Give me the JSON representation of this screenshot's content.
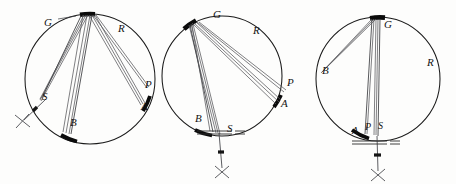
{
  "figure": {
    "background_color": "#fdfdfc",
    "ink_color": "#131313",
    "chord_color": "#55565a",
    "thick_arc_color": "#0b0b0b",
    "panel_count": 3
  },
  "panels": [
    {
      "name": "panel-left",
      "circle": {
        "cx": 90,
        "cy": 79,
        "r": 65
      },
      "labels": [
        {
          "name": "label-G",
          "text": "G",
          "x": 48,
          "y": 22
        },
        {
          "name": "label-R",
          "text": "R",
          "x": 122,
          "y": 28
        },
        {
          "name": "label-P",
          "text": "P",
          "x": 148,
          "y": 84
        },
        {
          "name": "label-A",
          "text": "A",
          "x": 145,
          "y": 106
        },
        {
          "name": "label-S",
          "text": "S",
          "x": 44,
          "y": 96
        },
        {
          "name": "label-B",
          "text": "B",
          "x": 72,
          "y": 122
        }
      ],
      "marker": {
        "name": "x-marker",
        "x": 22,
        "y": 121
      }
    },
    {
      "name": "panel-middle",
      "circle": {
        "cx": 222,
        "cy": 76,
        "r": 60
      },
      "labels": [
        {
          "name": "label-G",
          "text": "G",
          "x": 216,
          "y": 14
        },
        {
          "name": "label-R",
          "text": "R",
          "x": 256,
          "y": 30
        },
        {
          "name": "label-P",
          "text": "P",
          "x": 290,
          "y": 82
        },
        {
          "name": "label-A",
          "text": "A",
          "x": 284,
          "y": 103
        },
        {
          "name": "label-B",
          "text": "B",
          "x": 198,
          "y": 118
        },
        {
          "name": "label-S",
          "text": "S",
          "x": 229,
          "y": 128
        }
      ],
      "marker": {
        "name": "x-marker",
        "x": 222,
        "y": 172
      }
    },
    {
      "name": "panel-right",
      "circle": {
        "cx": 378,
        "cy": 79,
        "r": 62
      },
      "labels": [
        {
          "name": "label-G",
          "text": "G",
          "x": 387,
          "y": 24
        },
        {
          "name": "label-R",
          "text": "R",
          "x": 430,
          "y": 62
        },
        {
          "name": "label-B",
          "text": "B",
          "x": 326,
          "y": 70
        },
        {
          "name": "label-A",
          "text": "A",
          "x": 356,
          "y": 131
        },
        {
          "name": "label-P",
          "text": "P",
          "x": 369,
          "y": 127
        },
        {
          "name": "label-S",
          "text": "S",
          "x": 382,
          "y": 126
        }
      ],
      "marker": {
        "name": "x-marker",
        "x": 378,
        "y": 175
      }
    }
  ]
}
